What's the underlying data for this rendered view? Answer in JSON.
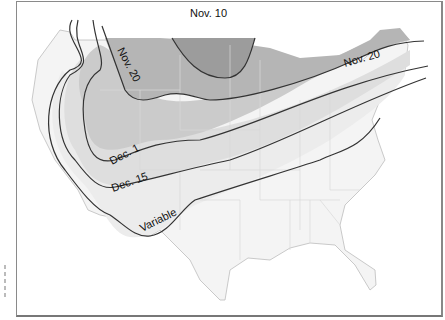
{
  "map": {
    "type": "isoline-map",
    "region": "Contiguous United States",
    "isolines": [
      {
        "label": "Nov. 10",
        "shade": "#9a9a9a"
      },
      {
        "label": "Nov. 20",
        "shade": "#b8b8b8"
      },
      {
        "label": "Nov. 20",
        "shade": "#b8b8b8"
      },
      {
        "label": "Dec. 1",
        "shade": "#cdcdcd"
      },
      {
        "label": "Dec. 15",
        "shade": "#e0e0e0"
      },
      {
        "label": "Variable",
        "shade": "#eeeeee"
      }
    ],
    "colors": {
      "background": "#ffffff",
      "border": "#8a8a8a",
      "state_lines": "#c8c8c8",
      "isoline_stroke": "#333333"
    }
  }
}
